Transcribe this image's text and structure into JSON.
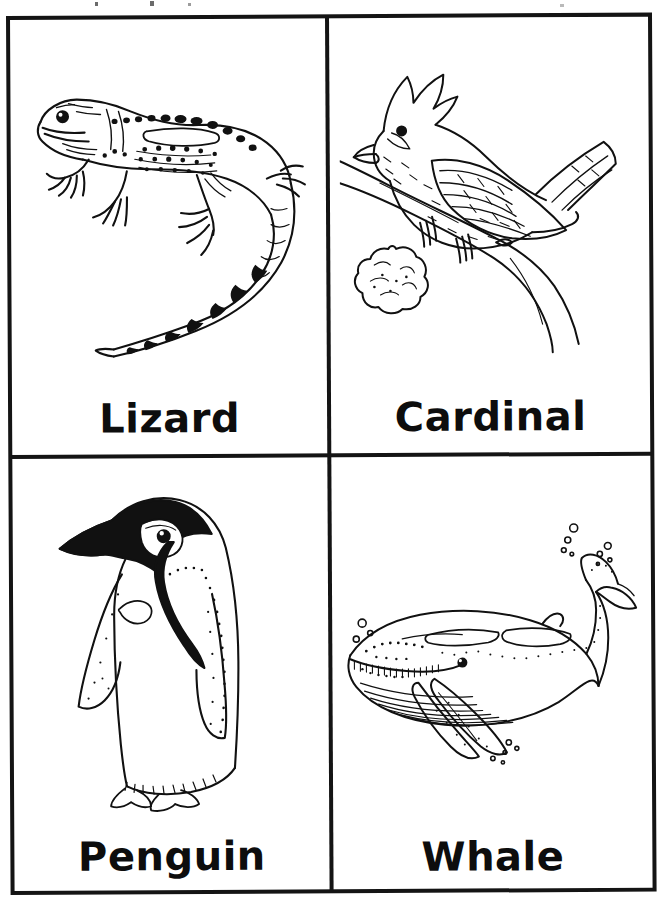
{
  "sheet": {
    "title": "Animal Flashcards",
    "background_color": "#ffffff",
    "ink_color": "#141414",
    "border_width_px": 4,
    "columns": 2,
    "rows": 2
  },
  "cards": [
    {
      "id": "lizard",
      "label": "Lizard",
      "illustration": "lizard-line-drawing",
      "description": "Black-and-white line drawing of a spotted lizard with a long curled, banded tail"
    },
    {
      "id": "cardinal",
      "label": "Cardinal",
      "illustration": "cardinal-line-drawing",
      "description": "Black-and-white line drawing of a crested cardinal perched on a branch with a blossom"
    },
    {
      "id": "penguin",
      "label": "Penguin",
      "illustration": "penguin-line-drawing",
      "description": "Black-and-white line drawing of a standing king penguin"
    },
    {
      "id": "whale",
      "label": "Whale",
      "illustration": "whale-line-drawing",
      "description": "Black-and-white line drawing of a humpback whale with bubbles"
    }
  ],
  "artifacts": {
    "top_edge_remnant": "faint cut-off text descenders at the very top of the scan"
  }
}
